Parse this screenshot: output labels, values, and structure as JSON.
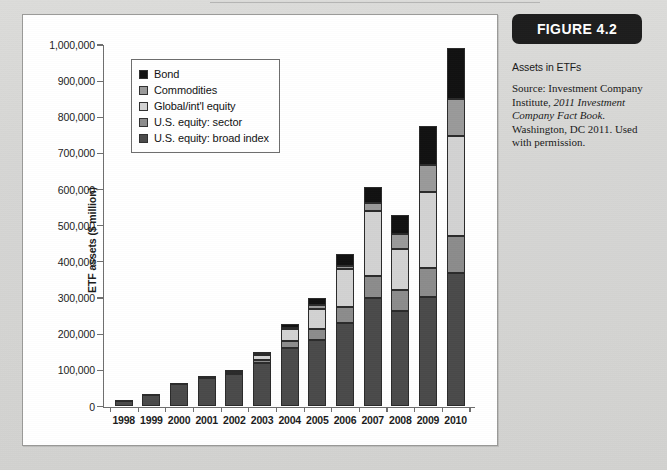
{
  "figure": {
    "badge_label": "FIGURE 4.2",
    "caption_title": "Assets in ETFs",
    "source_prefix": "Source: Investment Company Institute, ",
    "source_italic": "2011 Investment Company Fact Book.",
    "source_suffix": " Washington, DC 2011. Used with permission."
  },
  "chart_data": {
    "type": "bar",
    "subtype": "stacked-vertical",
    "title": "Assets in ETFs",
    "xlabel": "",
    "ylabel": "ETF assets ($ million)",
    "ylim": [
      0,
      1000000
    ],
    "ytick_step": 100000,
    "grid": false,
    "legend_position": "top-left-inside",
    "ytick_labels": [
      "0",
      "100,000",
      "200,000",
      "300,000",
      "400,000",
      "500,000",
      "600,000",
      "700,000",
      "800,000",
      "900,000",
      "1,000,000"
    ],
    "ytick_values": [
      0,
      100000,
      200000,
      300000,
      400000,
      500000,
      600000,
      700000,
      800000,
      900000,
      1000000
    ],
    "categories": [
      "1998",
      "1999",
      "2000",
      "2001",
      "2002",
      "2003",
      "2004",
      "2005",
      "2006",
      "2007",
      "2008",
      "2009",
      "2010"
    ],
    "stack_order_bottom_to_top": [
      "U.S. equity: broad index",
      "U.S. equity: sector",
      "Global/int'l equity",
      "Commodities",
      "Bond"
    ],
    "series": [
      {
        "name": "U.S. equity: broad index",
        "color": "#4a4a4a",
        "values": [
          15000,
          32000,
          63000,
          78000,
          90000,
          120000,
          162000,
          185000,
          231000,
          301000,
          264000,
          303000,
          368000
        ]
      },
      {
        "name": "U.S. equity: sector",
        "color": "#8c8c8c",
        "values": [
          0,
          0,
          0,
          0,
          4000,
          8000,
          18000,
          29000,
          44000,
          61000,
          59000,
          81000,
          103000
        ]
      },
      {
        "name": "Global/int'l equity",
        "color": "#d2d2d2",
        "values": [
          0,
          0,
          0,
          0,
          5000,
          15000,
          34000,
          56000,
          105000,
          178000,
          112000,
          208000,
          276000
        ]
      },
      {
        "name": "Commodities",
        "color": "#9a9a9a",
        "values": [
          0,
          0,
          0,
          0,
          0,
          3000,
          4000,
          12000,
          8000,
          22000,
          41000,
          75000,
          105000
        ]
      },
      {
        "name": "Bond",
        "color": "#111111",
        "values": [
          2000,
          2000,
          3000,
          5000,
          3000,
          5000,
          10000,
          19000,
          35000,
          46000,
          55000,
          110000,
          140000
        ]
      }
    ],
    "totals": [
      17000,
      34000,
      66000,
      83000,
      102000,
      151000,
      228000,
      301000,
      423000,
      608000,
      531000,
      777000,
      992000
    ]
  },
  "legend": {
    "items": [
      {
        "label": "Bond",
        "color": "#111111"
      },
      {
        "label": "Commodities",
        "color": "#9a9a9a"
      },
      {
        "label": "Global/int'l equity",
        "color": "#d2d2d2"
      },
      {
        "label": "U.S. equity: sector",
        "color": "#8c8c8c"
      },
      {
        "label": "U.S. equity: broad index",
        "color": "#4a4a4a"
      }
    ]
  }
}
